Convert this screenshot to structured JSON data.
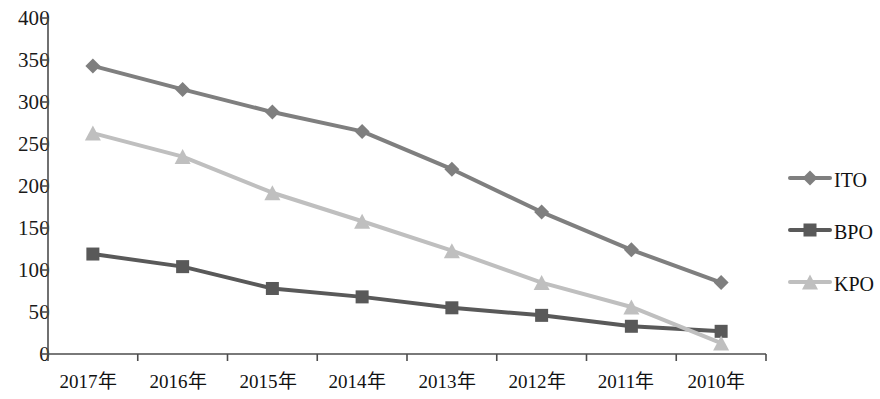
{
  "chart_data": {
    "type": "line",
    "title": "",
    "subtitle": "",
    "xlabel": "",
    "ylabel": "",
    "categories": [
      "2017年",
      "2016年",
      "2015年",
      "2014年",
      "2013年",
      "2012年",
      "2011年",
      "2010年"
    ],
    "yticks": [
      0,
      50,
      100,
      150,
      200,
      250,
      300,
      350,
      400
    ],
    "ytick_labels": [
      "0",
      "50",
      "100",
      "150",
      "200",
      "250",
      "300",
      "350",
      "400"
    ],
    "ylim": [
      0,
      400
    ],
    "grid": false,
    "legend_position": "right",
    "series": [
      {
        "name": "ITO",
        "marker": "diamond",
        "color": "#7f7f7f",
        "values": [
          343,
          315,
          288,
          265,
          220,
          169,
          124,
          85
        ]
      },
      {
        "name": "BPO",
        "marker": "square",
        "color": "#595959",
        "values": [
          119,
          104,
          78,
          68,
          55,
          46,
          33,
          27
        ]
      },
      {
        "name": "KPO",
        "marker": "triangle",
        "color": "#bfbfbf",
        "values": [
          263,
          235,
          192,
          158,
          123,
          85,
          56,
          13
        ]
      }
    ]
  },
  "legend": {
    "items": [
      {
        "label": "ITO"
      },
      {
        "label": "BPO"
      },
      {
        "label": "KPO"
      }
    ]
  },
  "axis": {
    "color": "#4d4d4d"
  }
}
